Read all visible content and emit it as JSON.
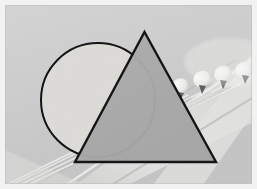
{
  "scene": {
    "title": "Geometric shapes overlaid on photograph of acoustic guitar headstock",
    "kind": "photograph-with-vector-overlay",
    "width": 257,
    "height": 189
  },
  "frame": {
    "border_label": "photo border",
    "border_color": "#f2f2f2",
    "border_width": 5,
    "content_rect": [
      5,
      5,
      247,
      179
    ]
  },
  "palette": {
    "background_gray": "#cdcdcd",
    "background_gray_light": "#d6d6d6",
    "background_gray_dark": "#c2c2c2",
    "circle_fill": "#dddcd9",
    "triangle_fill": "#a9a9a9",
    "outline_stroke": "#121212",
    "guitar_highlight": "#efefee",
    "guitar_shadow": "#9a9a99",
    "peg_button": "#f4f3f1",
    "peg_metal": "#6d6d6b",
    "string_light": "#e8e8e6"
  },
  "photo": {
    "subject": "acoustic guitar headstock with tuning pegs and strings",
    "lighting": "soft diffuse, low contrast",
    "orientation": "neck running from lower-left to upper-right",
    "peg_count": 4,
    "string_count": 4
  },
  "shapes": [
    {
      "name": "circle",
      "kind": "circle",
      "cx": 98,
      "cy": 100,
      "r": 57,
      "fill": "#dddcd9",
      "stroke": "#121212",
      "stroke_width": 2.0,
      "z": 1,
      "occluded_by": "triangle"
    },
    {
      "name": "triangle",
      "kind": "triangle",
      "points": "144.5,32 216,162 75,162",
      "apex": [
        144.5,
        32
      ],
      "bottom_left": [
        75,
        162
      ],
      "bottom_right": [
        216,
        162
      ],
      "fill": "#a9a9a9",
      "stroke": "#121212",
      "stroke_width": 2.4,
      "z": 2
    }
  ],
  "guitar": {
    "pegs": [
      {
        "name": "peg-1",
        "cx": 180,
        "cy": 86,
        "rx": 8.5,
        "ry": 7.5
      },
      {
        "name": "peg-2",
        "cx": 202,
        "cy": 79,
        "rx": 9.0,
        "ry": 8.0
      },
      {
        "name": "peg-3",
        "cx": 223,
        "cy": 74,
        "rx": 9.0,
        "ry": 8.0
      },
      {
        "name": "peg-4",
        "cx": 244,
        "cy": 70,
        "rx": 9.0,
        "ry": 8.0
      }
    ],
    "posts": [
      {
        "name": "post-1",
        "x": 180,
        "y": 93
      },
      {
        "name": "post-2",
        "x": 202,
        "y": 86
      },
      {
        "name": "post-3",
        "x": 223,
        "y": 81
      },
      {
        "name": "post-4",
        "x": 244,
        "y": 77
      }
    ],
    "strings": [
      {
        "name": "string-1",
        "x1": 8,
        "y1": 184,
        "x2": 188,
        "y2": 95
      },
      {
        "name": "string-2",
        "x1": 14,
        "y1": 184,
        "x2": 208,
        "y2": 89
      },
      {
        "name": "string-3",
        "x1": 22,
        "y1": 184,
        "x2": 228,
        "y2": 84
      },
      {
        "name": "string-4",
        "x1": 30,
        "y1": 184,
        "x2": 248,
        "y2": 80
      }
    ],
    "neck_edge_top": {
      "x1": 60,
      "y1": 184,
      "x2": 252,
      "y2": 60
    },
    "neck_edge_bottom": {
      "x1": 5,
      "y1": 184,
      "x2": 200,
      "y2": 110
    }
  }
}
